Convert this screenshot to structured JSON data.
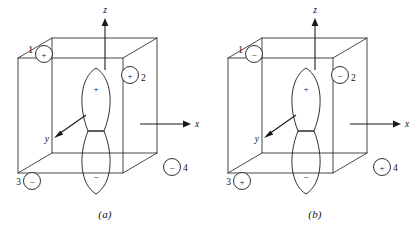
{
  "figure": {
    "panels": [
      {
        "caption": "(a)",
        "axes": [
          {
            "name": "z",
            "label": "z",
            "direction": "up"
          },
          {
            "name": "x",
            "label": "x",
            "direction": "right"
          },
          {
            "name": "y",
            "label": "y",
            "direction": "down-left"
          }
        ],
        "orbital": {
          "type": "p-orbital",
          "top_lobe_sign": "+",
          "bottom_lobe_sign": "−"
        },
        "corner_orbitals": [
          {
            "number": "1",
            "sign": "+",
            "position": "top-back-left"
          },
          {
            "number": "2",
            "sign": "+",
            "position": "top-front-right"
          },
          {
            "number": "3",
            "sign": "−",
            "position": "bottom-back-left"
          },
          {
            "number": "4",
            "sign": "−",
            "position": "bottom-front-right"
          }
        ]
      },
      {
        "caption": "(b)",
        "axes": [
          {
            "name": "z",
            "label": "z",
            "direction": "up"
          },
          {
            "name": "x",
            "label": "x",
            "direction": "right"
          },
          {
            "name": "y",
            "label": "y",
            "direction": "down-left"
          }
        ],
        "orbital": {
          "type": "p-orbital",
          "top_lobe_sign": "+",
          "bottom_lobe_sign": "−"
        },
        "corner_orbitals": [
          {
            "number": "1",
            "sign": "−",
            "position": "top-back-left"
          },
          {
            "number": "2",
            "sign": "−",
            "position": "top-front-right"
          },
          {
            "number": "3",
            "sign": "+",
            "position": "bottom-back-left"
          },
          {
            "number": "4",
            "sign": "+",
            "position": "bottom-front-right"
          }
        ]
      }
    ],
    "colors": {
      "line": "#1a1a1a",
      "background": "#ffffff",
      "text": "#111111"
    }
  }
}
